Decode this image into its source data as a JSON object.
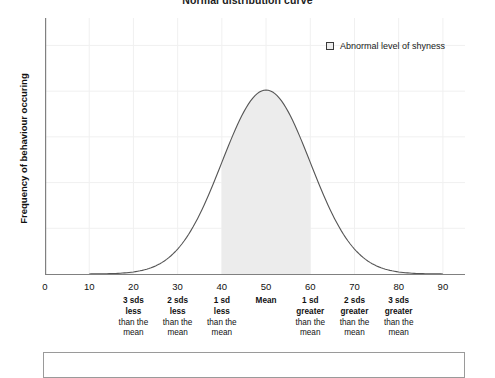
{
  "chart_data": {
    "type": "area",
    "title": "Normal distribution curve",
    "xlabel": "",
    "ylabel": "Frequency of behaviour occuring",
    "xlim": [
      0,
      95
    ],
    "ylim": [
      0,
      1
    ],
    "grid": true,
    "legend_position": "top-right",
    "legend": [
      {
        "label": "Abnormal level of shyness",
        "swatch": "legend-swatch-icon",
        "color": "#ececec"
      }
    ],
    "x_ticks": [
      {
        "value": 0,
        "label": "0"
      },
      {
        "value": 10,
        "label": "10"
      },
      {
        "value": 20,
        "label": "20"
      },
      {
        "value": 30,
        "label": "30"
      },
      {
        "value": 40,
        "label": "40"
      },
      {
        "value": 50,
        "label": "50"
      },
      {
        "value": 60,
        "label": "60"
      },
      {
        "value": 70,
        "label": "70"
      },
      {
        "value": 80,
        "label": "80"
      },
      {
        "value": 90,
        "label": "90"
      }
    ],
    "curve": {
      "name": "Normal distribution",
      "mean": 50,
      "sd": 10,
      "line_color": "#555555",
      "x": [
        10,
        15,
        20,
        25,
        30,
        35,
        40,
        45,
        50,
        55,
        60,
        65,
        70,
        75,
        80,
        85,
        90
      ],
      "y": [
        0.0,
        0.01,
        0.03,
        0.09,
        0.2,
        0.39,
        0.64,
        0.88,
        1.0,
        0.88,
        0.64,
        0.39,
        0.2,
        0.09,
        0.03,
        0.01,
        0.0
      ]
    },
    "shaded_regions": [
      {
        "name": "left-tail-shade",
        "from": 10,
        "to": 20,
        "color": "#ececec"
      },
      {
        "name": "central-shade",
        "from": 40,
        "to": 60,
        "color": "#ececec"
      },
      {
        "name": "right-tail-shade",
        "from": 80,
        "to": 90,
        "color": "#ececec"
      }
    ],
    "annotations": [
      {
        "value": 20,
        "head": "3 sds",
        "sub": "less",
        "tail1": "than the",
        "tail2": "mean"
      },
      {
        "value": 30,
        "head": "2 sds",
        "sub": "less",
        "tail1": "than the",
        "tail2": "mean"
      },
      {
        "value": 40,
        "head": "1 sd",
        "sub": "less",
        "tail1": "than the",
        "tail2": "mean"
      },
      {
        "value": 50,
        "head": "Mean",
        "sub": "",
        "tail1": "",
        "tail2": ""
      },
      {
        "value": 60,
        "head": "1 sd",
        "sub": "greater",
        "tail1": "than the",
        "tail2": "mean"
      },
      {
        "value": 70,
        "head": "2 sds",
        "sub": "greater",
        "tail1": "than the",
        "tail2": "mean"
      },
      {
        "value": 80,
        "head": "3 sds",
        "sub": "greater",
        "tail1": "than the",
        "tail2": "mean"
      }
    ],
    "colors": {
      "axis": "#808080",
      "grid": "#f0f0f0",
      "curve": "#555555",
      "shade": "#ececec",
      "panel_border": "#9a9a9a"
    }
  }
}
